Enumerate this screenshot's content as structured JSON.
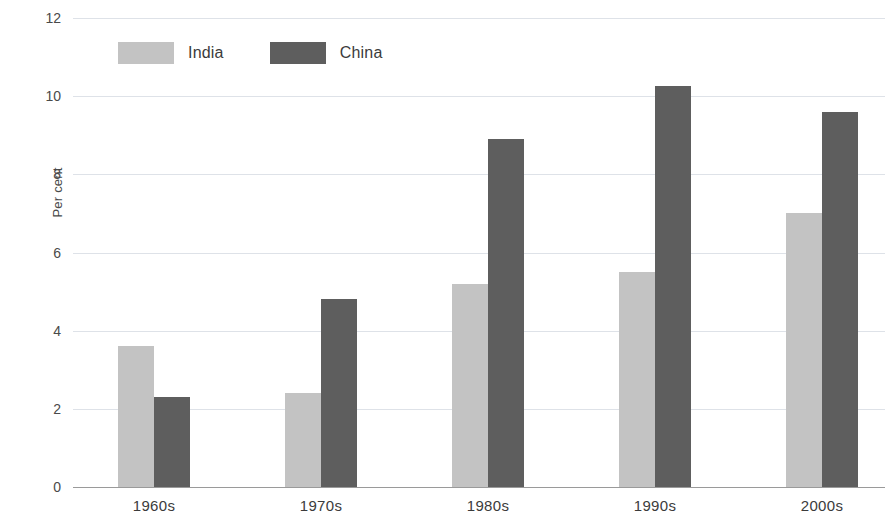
{
  "chart_data": {
    "type": "bar",
    "title": "",
    "subtitle": "",
    "xlabel": "",
    "ylabel": "Per cent",
    "categories": [
      "1960s",
      "1970s",
      "1980s",
      "1990s",
      "2000s"
    ],
    "series": [
      {
        "name": "India",
        "color": "#c3c3c3",
        "values": [
          3.6,
          2.4,
          5.2,
          5.5,
          7.0
        ]
      },
      {
        "name": "China",
        "color": "#5e5e5e",
        "values": [
          2.3,
          4.8,
          8.9,
          10.25,
          9.6
        ]
      }
    ],
    "ylim": [
      0,
      12
    ],
    "ytick_values": [
      12,
      10,
      8,
      6,
      4,
      2,
      0
    ],
    "ytick_labels": [
      "12",
      "10",
      "8",
      "6",
      "4",
      "2",
      "0"
    ],
    "grid": true,
    "grid_axis": "y",
    "legend_position": "top-left",
    "bar_layout": "grouped",
    "annotations": []
  },
  "legend": {
    "items": [
      {
        "label": "India",
        "swatch": "legend-swatch-india"
      },
      {
        "label": "China",
        "swatch": "legend-swatch-china"
      }
    ]
  }
}
